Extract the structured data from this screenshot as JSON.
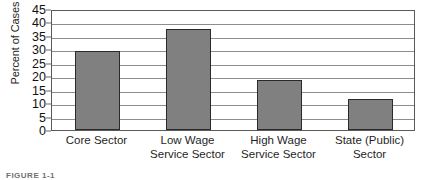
{
  "chart_data": {
    "type": "bar",
    "title": "",
    "subtitle": "",
    "xlabel": "",
    "ylabel": "Percent of Cases",
    "ylim": [
      0,
      45
    ],
    "ytick_step": 5,
    "yticks": [
      0,
      5,
      10,
      15,
      20,
      25,
      30,
      35,
      40,
      45
    ],
    "grid": true,
    "legend": false,
    "legend_position": "none",
    "bar_color": "#808080",
    "bar_edge_color": "#2a2a2a",
    "categories": [
      "Core Sector",
      "Low Wage Service Sector",
      "High Wage Service Sector",
      "State (Public) Sector"
    ],
    "category_lines": [
      [
        "Core Sector"
      ],
      [
        "Low Wage",
        "Service Sector"
      ],
      [
        "High Wage",
        "Service Sector"
      ],
      [
        "State (Public)",
        "Sector"
      ]
    ],
    "values": [
      29.5,
      37.5,
      18.5,
      11.5
    ]
  },
  "caption": {
    "text": "FIGURE 1-1"
  }
}
